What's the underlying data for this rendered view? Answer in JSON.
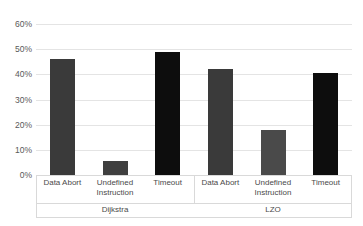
{
  "chart_data": {
    "type": "bar",
    "title": "",
    "xlabel": "",
    "ylabel": "",
    "ylim": [
      0,
      60
    ],
    "grid": true,
    "legend": "none",
    "ytick_labels": [
      "60%",
      "50%",
      "40%",
      "30%",
      "20%",
      "10%",
      "0%"
    ],
    "ytick_values": [
      60,
      50,
      40,
      30,
      20,
      10,
      0
    ],
    "groups": [
      {
        "name": "Dijkstra",
        "categories": [
          "Data Abort",
          "Undefined Instruction",
          "Timeout"
        ],
        "values": [
          46,
          5.5,
          49
        ]
      },
      {
        "name": "LZO",
        "categories": [
          "Data Abort",
          "Undefined Instruction",
          "Timeout"
        ],
        "values": [
          42,
          18,
          40.5
        ]
      }
    ],
    "bars": [
      {
        "group": "Dijkstra",
        "category": "Data Abort",
        "label": "Data Abort",
        "value": 46,
        "color": "#3a3a3a"
      },
      {
        "group": "Dijkstra",
        "category": "Undefined Instruction",
        "label": "Undefined\nInstruction",
        "value": 5.5,
        "color": "#3f3f3f"
      },
      {
        "group": "Dijkstra",
        "category": "Timeout",
        "label": "Timeout",
        "value": 49,
        "color": "#0d0d0d"
      },
      {
        "group": "LZO",
        "category": "Data Abort",
        "label": "Data Abort",
        "value": 42,
        "color": "#3a3a3a"
      },
      {
        "group": "LZO",
        "category": "Undefined Instruction",
        "label": "Undefined\nInstruction",
        "value": 18,
        "color": "#4a4a4a"
      },
      {
        "group": "LZO",
        "category": "Timeout",
        "label": "Timeout",
        "value": 40.5,
        "color": "#0d0d0d"
      }
    ],
    "colors": {
      "data_abort": "#3a3a3a",
      "undefined_instruction": "#454545",
      "timeout": "#0d0d0d",
      "gridline": "#e4e4e4",
      "axis": "#d9d9d9",
      "background": "#ffffff"
    }
  },
  "title_sliver": ""
}
